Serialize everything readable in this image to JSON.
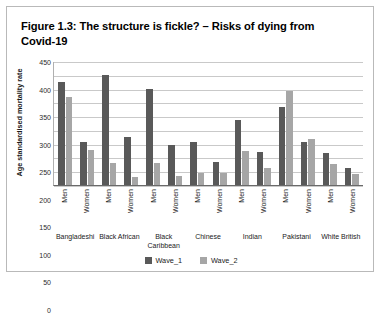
{
  "figure": {
    "title": "Figure 1.3: The structure is fickle? – Risks of dying from Covid-19"
  },
  "legend": {
    "items": [
      {
        "label": "Wave_1",
        "color": "#595959"
      },
      {
        "label": "Wave_2",
        "color": "#a6a6a6"
      }
    ]
  },
  "axis": {
    "yticks": [
      "0",
      "50",
      "100",
      "150",
      "200",
      "250",
      "300",
      "350",
      "400",
      "450"
    ],
    "sublabels": [
      "Men",
      "Women"
    ]
  },
  "chart_data": {
    "type": "bar",
    "title": "Figure 1.3: The structure is fickle? – Risks of dying from Covid-19",
    "xlabel": "",
    "ylabel": "Age standardised mortality rate",
    "ylim": [
      0,
      450
    ],
    "ytick_step": 50,
    "grid": true,
    "legend_position": "bottom",
    "categories": [
      "Bangladeshi",
      "Black African",
      "Black Caribbean",
      "Chinese",
      "Indian",
      "Pakistani",
      "White British"
    ],
    "subgroups": [
      "Men",
      "Women"
    ],
    "series": [
      {
        "name": "Wave_1",
        "color": "#595959",
        "values": {
          "Men": [
            375,
            400,
            348,
            155,
            237,
            282,
            118
          ],
          "Women": [
            155,
            173,
            147,
            83,
            120,
            157,
            63
          ]
        }
      },
      {
        "name": "Wave_2",
        "color": "#a6a6a6",
        "values": {
          "Men": [
            318,
            80,
            80,
            45,
            124,
            340,
            76
          ],
          "Women": [
            128,
            30,
            33,
            45,
            62,
            166,
            40
          ]
        }
      }
    ]
  }
}
